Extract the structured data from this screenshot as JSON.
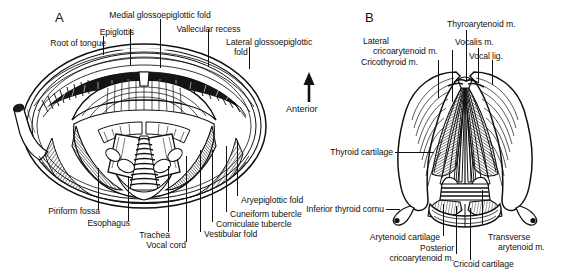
{
  "figure": {
    "background_color": "#ffffff",
    "ink_color": "#111111",
    "width": 561,
    "height": 275
  },
  "orientation": {
    "arrow_label": "Anterior",
    "arrow_direction": "up"
  },
  "panels": [
    {
      "letter": "A",
      "caption": "Laryngoscopic view of the larynx",
      "labels": [
        {
          "id": "root-of-tongue",
          "text": "Root of tongue"
        },
        {
          "id": "epiglottis",
          "text": "Epiglottis"
        },
        {
          "id": "medial-glossoepiglottic-fold",
          "text": "Medial glossoepiglottic fold"
        },
        {
          "id": "vallecular-recess",
          "text": "Vallecular recess"
        },
        {
          "id": "lateral-glossoepiglottic-fold-l1",
          "text": "Lateral glossoepiglottic"
        },
        {
          "id": "lateral-glossoepiglottic-fold-l2",
          "text": "fold"
        },
        {
          "id": "piriform-fossa",
          "text": "Piriform fossa"
        },
        {
          "id": "esophagus",
          "text": "Esophagus"
        },
        {
          "id": "trachea",
          "text": "Trachea"
        },
        {
          "id": "vocal-cord",
          "text": "Vocal cord"
        },
        {
          "id": "vestibular-fold",
          "text": "Vestibular fold"
        },
        {
          "id": "corniculate-tubercle",
          "text": "Corniculate tubercle"
        },
        {
          "id": "cuneiform-tubercle",
          "text": "Cuneiform tubercle"
        },
        {
          "id": "aryepiglottic-fold",
          "text": "Aryepiglottic fold"
        }
      ]
    },
    {
      "letter": "B",
      "caption": "Posterior view of the laryngeal cartilages and intrinsic muscles",
      "labels": [
        {
          "id": "lateral-cricoarytenoid-l1",
          "text": "Lateral"
        },
        {
          "id": "lateral-cricoarytenoid-l2",
          "text": "cricoarytenoid m."
        },
        {
          "id": "cricothyroid",
          "text": "Cricothyroid m."
        },
        {
          "id": "thyroarytenoid",
          "text": "Thyroarytenoid m."
        },
        {
          "id": "vocalis",
          "text": "Vocalis m."
        },
        {
          "id": "vocal-lig",
          "text": "Vocal lig."
        },
        {
          "id": "thyroid-cartilage",
          "text": "Thyroid cartilage"
        },
        {
          "id": "inferior-thyroid-cornu",
          "text": "Inferior thyroid cornu"
        },
        {
          "id": "arytenoid-cartilage",
          "text": "Arytenoid cartilage"
        },
        {
          "id": "posterior-cricoarytenoid-l1",
          "text": "Posterior"
        },
        {
          "id": "posterior-cricoarytenoid-l2",
          "text": "cricoarytenoid m."
        },
        {
          "id": "transverse-arytenoid-l1",
          "text": "Transverse"
        },
        {
          "id": "transverse-arytenoid-l2",
          "text": "arytenoid m."
        },
        {
          "id": "cricoid-cartilage",
          "text": "Cricoid cartilage"
        }
      ]
    }
  ]
}
